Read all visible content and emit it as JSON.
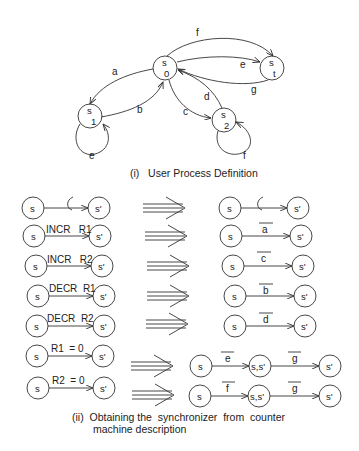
{
  "figure": {
    "part1": {
      "caption": "(i)   User Process Definition",
      "states": [
        {
          "id": "s0",
          "main": "s",
          "sub": "0"
        },
        {
          "id": "s1",
          "main": "s",
          "sub": "1"
        },
        {
          "id": "s2",
          "main": "s",
          "sub": "2"
        },
        {
          "id": "st",
          "main": "s",
          "sub": "t"
        }
      ],
      "edges": [
        {
          "from": "s0",
          "to": "s1",
          "label": "a"
        },
        {
          "from": "s1",
          "to": "s0",
          "label": "b"
        },
        {
          "from": "s0",
          "to": "s2",
          "label": "c"
        },
        {
          "from": "s2",
          "to": "s0",
          "label": "d"
        },
        {
          "from": "s0",
          "to": "st",
          "label": "e"
        },
        {
          "from": "s0",
          "to": "st",
          "label": "f"
        },
        {
          "from": "st",
          "to": "s0",
          "label": "g"
        },
        {
          "from": "s1",
          "to": "s1",
          "label": "e"
        },
        {
          "from": "s2",
          "to": "s2",
          "label": "f"
        }
      ]
    },
    "part2": {
      "caption_line1": "(ii)  Obtaining the  synchronizer  from  counter",
      "caption_line2": "machine description",
      "rows": [
        {
          "left_from": "s",
          "left_label": "ε",
          "left_to": "s'",
          "right_from": "s",
          "right_label": "ε",
          "right_to": "s'"
        },
        {
          "left_from": "s",
          "left_label": "INCR   R1",
          "left_to": "s'",
          "right_from": "s",
          "right_label": "a",
          "right_to": "s'"
        },
        {
          "left_from": "s",
          "left_label": "INCR   R2",
          "left_to": "s'",
          "right_from": "s",
          "right_label": "c",
          "right_to": "s'"
        },
        {
          "left_from": "s",
          "left_label": "DECR  R1",
          "left_to": "s'",
          "right_from": "s",
          "right_label": "b",
          "right_to": "s'"
        },
        {
          "left_from": "s",
          "left_label": "DECR  R2",
          "left_to": "s'",
          "right_from": "s",
          "right_label": "d",
          "right_to": "s'"
        },
        {
          "left_from": "s",
          "left_label": "R1  = 0",
          "left_to": "s'",
          "right_from": "s",
          "right_label": "e",
          "right_mid": "s,s'",
          "right_label2": "g",
          "right_to": "s'"
        },
        {
          "left_from": "s",
          "left_label": "R2  = 0",
          "left_to": "s'",
          "right_from": "s",
          "right_label": "f",
          "right_mid": "s,s'",
          "right_label2": "g",
          "right_to": "s'"
        }
      ]
    }
  }
}
